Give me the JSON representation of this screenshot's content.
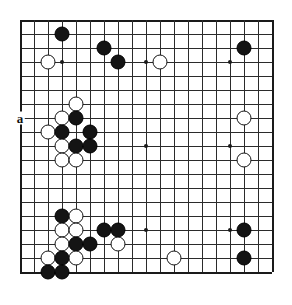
{
  "diagram": {
    "type": "go-board-position",
    "board_size": 19,
    "origin_x": 20,
    "origin_y": 20,
    "cell_size": 14,
    "star_points": [
      {
        "col": 4,
        "row": 4
      },
      {
        "col": 10,
        "row": 4
      },
      {
        "col": 16,
        "row": 4
      },
      {
        "col": 4,
        "row": 10
      },
      {
        "col": 10,
        "row": 10
      },
      {
        "col": 16,
        "row": 10
      },
      {
        "col": 4,
        "row": 16
      },
      {
        "col": 10,
        "row": 16
      },
      {
        "col": 16,
        "row": 16
      }
    ],
    "colors": {
      "black_stone": "#141414",
      "white_stone": "#ffffff",
      "stone_outline": "#141414",
      "grid_line": "#2b2b2b",
      "board_background": "#ffffff",
      "label_text": "#111111"
    },
    "stones": [
      {
        "color": "black",
        "col": 4,
        "row": 2
      },
      {
        "color": "black",
        "col": 7,
        "row": 3
      },
      {
        "color": "white",
        "col": 3,
        "row": 4
      },
      {
        "color": "black",
        "col": 8,
        "row": 4
      },
      {
        "color": "white",
        "col": 11,
        "row": 4
      },
      {
        "color": "black",
        "col": 17,
        "row": 3
      },
      {
        "color": "white",
        "col": 5,
        "row": 7
      },
      {
        "color": "white",
        "col": 4,
        "row": 8
      },
      {
        "color": "black",
        "col": 5,
        "row": 8
      },
      {
        "color": "white",
        "col": 3,
        "row": 9
      },
      {
        "color": "black",
        "col": 4,
        "row": 9
      },
      {
        "color": "black",
        "col": 6,
        "row": 9
      },
      {
        "color": "white",
        "col": 4,
        "row": 10
      },
      {
        "color": "black",
        "col": 5,
        "row": 10
      },
      {
        "color": "black",
        "col": 6,
        "row": 10
      },
      {
        "color": "white",
        "col": 4,
        "row": 11
      },
      {
        "color": "white",
        "col": 5,
        "row": 11
      },
      {
        "color": "white",
        "col": 17,
        "row": 8
      },
      {
        "color": "white",
        "col": 17,
        "row": 11
      },
      {
        "color": "black",
        "col": 4,
        "row": 15
      },
      {
        "color": "white",
        "col": 5,
        "row": 15
      },
      {
        "color": "white",
        "col": 4,
        "row": 16
      },
      {
        "color": "white",
        "col": 5,
        "row": 16
      },
      {
        "color": "black",
        "col": 7,
        "row": 16
      },
      {
        "color": "black",
        "col": 8,
        "row": 16
      },
      {
        "color": "white",
        "col": 4,
        "row": 17
      },
      {
        "color": "black",
        "col": 5,
        "row": 17
      },
      {
        "color": "black",
        "col": 6,
        "row": 17
      },
      {
        "color": "white",
        "col": 8,
        "row": 17
      },
      {
        "color": "white",
        "col": 3,
        "row": 18
      },
      {
        "color": "black",
        "col": 4,
        "row": 18
      },
      {
        "color": "white",
        "col": 5,
        "row": 18
      },
      {
        "color": "black",
        "col": 3,
        "row": 19
      },
      {
        "color": "black",
        "col": 4,
        "row": 19
      },
      {
        "color": "white",
        "col": 12,
        "row": 18
      },
      {
        "color": "black",
        "col": 17,
        "row": 16
      },
      {
        "color": "black",
        "col": 17,
        "row": 18
      }
    ],
    "labels": [
      {
        "text": "a",
        "col": 1,
        "row": 8,
        "name": "point-label-a"
      }
    ]
  }
}
